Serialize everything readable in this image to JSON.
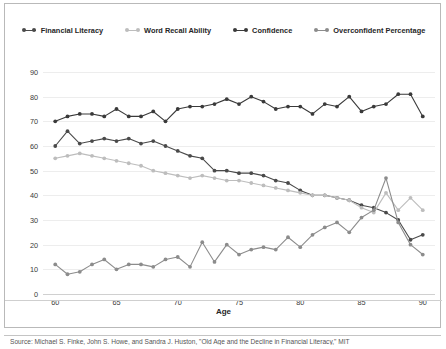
{
  "chart_data": {
    "type": "line",
    "title": "",
    "xlabel": "Age",
    "ylabel": "",
    "xlim": [
      59,
      91
    ],
    "ylim": [
      0,
      90
    ],
    "grid": true,
    "legend_position": "top",
    "x": [
      60,
      61,
      62,
      63,
      64,
      65,
      66,
      67,
      68,
      69,
      70,
      71,
      72,
      73,
      74,
      75,
      76,
      77,
      78,
      79,
      80,
      81,
      82,
      83,
      84,
      85,
      86,
      87,
      88,
      89,
      90
    ],
    "xticks": [
      60,
      65,
      70,
      75,
      80,
      85,
      90
    ],
    "yticks": [
      0,
      10,
      20,
      30,
      40,
      50,
      60,
      70,
      80,
      90
    ],
    "series": [
      {
        "name": "Financial Literacy",
        "color": "#4a4a4a",
        "values": [
          60,
          66,
          61,
          62,
          63,
          62,
          63,
          61,
          62,
          60,
          58,
          56,
          55,
          50,
          50,
          49,
          49,
          48,
          46,
          45,
          42,
          40,
          40,
          39,
          38,
          36,
          35,
          33,
          30,
          22,
          24
        ]
      },
      {
        "name": "Word Recall Ability",
        "color": "#bdbdbd",
        "values": [
          55,
          56,
          57,
          56,
          55,
          54,
          53,
          52,
          50,
          49,
          48,
          47,
          48,
          47,
          46,
          46,
          45,
          44,
          43,
          42,
          41,
          40,
          40,
          39,
          38,
          35,
          33,
          41,
          34,
          39,
          34
        ]
      },
      {
        "name": "Confidence",
        "color": "#3a3a3a",
        "values": [
          70,
          72,
          73,
          73,
          72,
          75,
          72,
          72,
          74,
          70,
          75,
          76,
          76,
          77,
          79,
          77,
          80,
          78,
          75,
          76,
          76,
          73,
          77,
          76,
          80,
          74,
          76,
          77,
          81,
          81,
          72
        ]
      },
      {
        "name": "Overconfident Percentage",
        "color": "#8c8c8c",
        "values": [
          12,
          8,
          9,
          12,
          14,
          10,
          12,
          12,
          11,
          14,
          15,
          11,
          21,
          13,
          20,
          16,
          18,
          19,
          18,
          23,
          19,
          24,
          27,
          29,
          25,
          31,
          34,
          47,
          29,
          20,
          16
        ]
      }
    ]
  },
  "legend": {
    "items": [
      {
        "label": "Financial Literacy"
      },
      {
        "label": "Word Recall Ability"
      },
      {
        "label": "Confidence"
      },
      {
        "label": "Overconfident Percentage"
      }
    ]
  },
  "caption": {
    "text": "Source: Michael S. Finke, John S. Howe, and Sandra J. Huston, \"Old Age and the Decline in Financial Literacy,\" MIT"
  }
}
